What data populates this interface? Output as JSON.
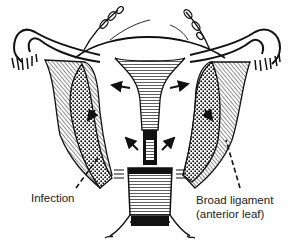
{
  "figure": {
    "labels": {
      "infection": "Infection",
      "broad_ligament_line1": "Broad ligament",
      "broad_ligament_line2": "(anterior leaf)"
    },
    "colors": {
      "ink": "#111111",
      "background": "#ffffff"
    }
  }
}
